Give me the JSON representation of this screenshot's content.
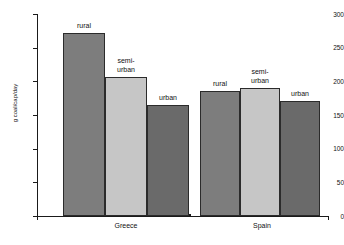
{
  "chart_data": {
    "type": "bar",
    "title": "",
    "xlabel": "",
    "ylabel": "g coal/cap/day",
    "ylim": [
      0,
      300
    ],
    "ytick_values": [
      0,
      50,
      100,
      150,
      200,
      250,
      300
    ],
    "ytick_labels": [
      "0",
      "50",
      "100",
      "150",
      "200",
      "250",
      "300"
    ],
    "grid": false,
    "legend": "none (bars labelled directly)",
    "categories": [
      "Greece",
      "Spain"
    ],
    "series": [
      {
        "name": "rural",
        "values": [
          272,
          185
        ]
      },
      {
        "name": "semi-urban",
        "values": [
          206,
          190
        ]
      },
      {
        "name": "urban",
        "values": [
          165,
          171
        ]
      }
    ],
    "annotations": [
      {
        "text": "rural",
        "group": "Greece",
        "series": "rural"
      },
      {
        "text": "semi-\nurban",
        "group": "Greece",
        "series": "semi-urban"
      },
      {
        "text": "urban",
        "group": "Greece",
        "series": "urban"
      },
      {
        "text": "rural",
        "group": "Spain",
        "series": "rural"
      },
      {
        "text": "semi-\nurban",
        "group": "Spain",
        "series": "semi-urban"
      },
      {
        "text": "urban",
        "group": "Spain",
        "series": "urban"
      }
    ],
    "colors": {
      "rural": "#7d7d7d",
      "semi_urban": "#c6c6c6",
      "urban": "#6a6a6a",
      "axis": "#1a1a1a",
      "background": "#ffffff"
    }
  },
  "axes": {
    "y_label": "g coal/cap/day",
    "ticks": [
      {
        "label": "300"
      },
      {
        "label": "250"
      },
      {
        "label": "200"
      },
      {
        "label": "150"
      },
      {
        "label": "100"
      },
      {
        "label": "50"
      },
      {
        "label": "0"
      }
    ]
  },
  "groups": [
    {
      "name": "Greece",
      "bars": [
        {
          "series": "rural",
          "label": "rural",
          "value": 272
        },
        {
          "series": "semi-urban",
          "label": "semi-\nurban",
          "value": 206
        },
        {
          "series": "urban",
          "label": "urban",
          "value": 165
        }
      ]
    },
    {
      "name": "Spain",
      "bars": [
        {
          "series": "rural",
          "label": "rural",
          "value": 185
        },
        {
          "series": "semi-urban",
          "label": "semi-\nurban",
          "value": 190
        },
        {
          "series": "urban",
          "label": "urban",
          "value": 171
        }
      ]
    }
  ]
}
